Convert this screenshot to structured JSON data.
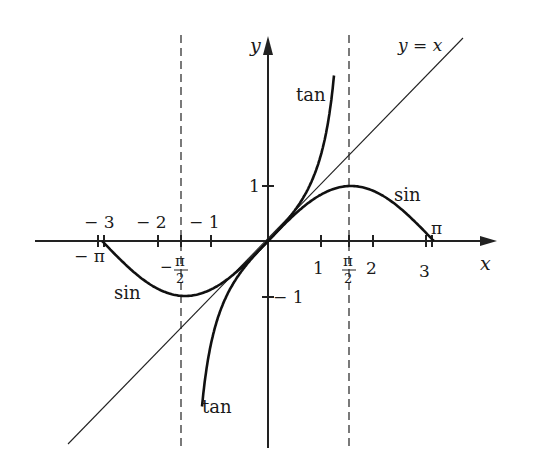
{
  "chart_data": {
    "type": "line",
    "title": "",
    "xlabel": "x",
    "ylabel": "y",
    "xlim": [
      -3.14159,
      3.14159
    ],
    "ylim": [
      -3,
      3.8
    ],
    "grid": false,
    "series": [
      {
        "name": "sin",
        "domain": [
          -3.14159,
          3.14159
        ],
        "function": "sin(x)"
      },
      {
        "name": "tan",
        "domain": [
          -1.25,
          1.25
        ],
        "function": "tan(x)"
      },
      {
        "name": "y = x",
        "domain": [
          -3.8,
          3.8
        ],
        "function": "x"
      }
    ],
    "asymptotes": [
      -1.5708,
      1.5708
    ],
    "x_ticks": [
      "-3",
      "-2",
      "-1",
      "1",
      "2",
      "3"
    ],
    "x_special_ticks": [
      "-π",
      "-π/2",
      "π/2",
      "π"
    ],
    "y_ticks": [
      "1",
      "-1"
    ],
    "annotations": [
      "tan",
      "tan",
      "sin",
      "sin",
      "y = x",
      "π",
      "-π"
    ]
  },
  "labels": {
    "x_axis": "x",
    "y_axis": "y",
    "line_yx": "y = x",
    "tan_upper": "tan",
    "tan_lower": "tan",
    "sin_right": "sin",
    "sin_left": "sin",
    "pi": "π",
    "neg_pi": "− π",
    "tick_neg3": "− 3",
    "tick_neg2": "− 2",
    "tick_neg1": "− 1",
    "tick_1": "1",
    "tick_2": "2",
    "tick_3": "3",
    "ytick_1": "1",
    "ytick_neg1": "− 1",
    "pi_num": "π",
    "two_den": "2",
    "minus": "−"
  }
}
